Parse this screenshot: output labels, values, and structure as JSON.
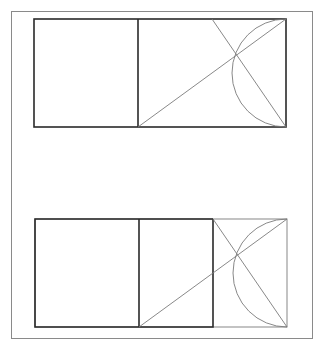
{
  "diagram": {
    "colors": {
      "frame": "#8a8a8a",
      "thick_line": "#2a2a2a",
      "thin_line": "#7a7a7a",
      "background": "#ffffff"
    },
    "panels": [
      {
        "name": "top",
        "rect": {
          "x1": 34,
          "y1": 19,
          "x2": 286,
          "y2": 127
        },
        "divider_x": 138,
        "inner_square_right": null
      },
      {
        "name": "bottom",
        "rect": {
          "x1": 35,
          "y1": 219,
          "x2": 287,
          "y2": 327
        },
        "divider_x": 139,
        "inner_square_right": 213
      }
    ]
  }
}
